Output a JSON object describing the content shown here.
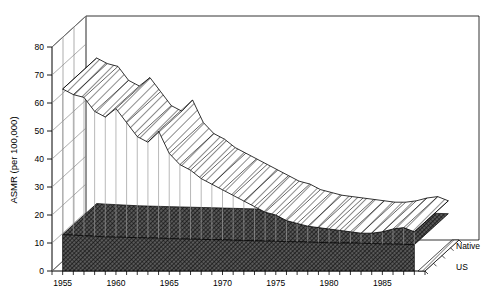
{
  "chart_data": {
    "type": "area",
    "title": "",
    "subtitle": "",
    "xlabel": "",
    "ylabel": "ASMR (per 100,000)",
    "ylim": [
      0,
      85
    ],
    "yticks": [
      0,
      10,
      20,
      30,
      40,
      50,
      60,
      70,
      80
    ],
    "ytick_labels": [
      "0",
      "10",
      "20",
      "30",
      "40",
      "50",
      "60",
      "70",
      "80"
    ],
    "xlim": [
      1954,
      1989
    ],
    "xticks_major": [
      1955,
      1960,
      1965,
      1970,
      1975,
      1980,
      1985
    ],
    "xtick_labels": [
      "1955",
      "1960",
      "1965",
      "1970",
      "1975",
      "1980",
      "1985"
    ],
    "grid": false,
    "legend_position": "right",
    "projection": "3d-ribbon",
    "x": [
      1955,
      1956,
      1957,
      1958,
      1959,
      1960,
      1961,
      1962,
      1963,
      1964,
      1965,
      1966,
      1967,
      1968,
      1969,
      1970,
      1971,
      1972,
      1973,
      1974,
      1975,
      1976,
      1977,
      1978,
      1979,
      1980,
      1981,
      1982,
      1983,
      1984,
      1985,
      1986,
      1987,
      1988
    ],
    "series": [
      {
        "name": "Native",
        "fill": "#ffffff",
        "hatch": "diagonal",
        "values": [
          65,
          63,
          62,
          57,
          55,
          58,
          53,
          48,
          46,
          50,
          42,
          38,
          36,
          33,
          31,
          29,
          27,
          25,
          23,
          21,
          20,
          18,
          17,
          16,
          15.5,
          15,
          14.5,
          14,
          13.5,
          13.5,
          14,
          15,
          15.5,
          14
        ]
      },
      {
        "name": "US",
        "fill": "#4a4a4a",
        "hatch": "crosshatch",
        "values": [
          13,
          12.8,
          12.6,
          12.4,
          12.2,
          12.1,
          12,
          11.9,
          11.8,
          11.7,
          11.6,
          11.5,
          11.4,
          11.3,
          11.2,
          11.1,
          11,
          10.9,
          10.8,
          10.7,
          10.6,
          10.5,
          10.4,
          10.3,
          10.2,
          10.1,
          10,
          10,
          9.9,
          9.8,
          9.7,
          9.6,
          9.5,
          9.4
        ]
      }
    ],
    "legend": [
      {
        "label": "Native"
      },
      {
        "label": "US"
      }
    ]
  },
  "figure": {
    "background": "#ffffff",
    "line_color": "#000000"
  }
}
